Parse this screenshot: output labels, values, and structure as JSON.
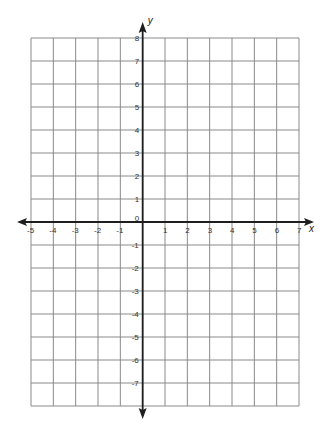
{
  "chart_data": {
    "type": "coordinate-grid",
    "title": "",
    "xlabel": "x",
    "ylabel": "y",
    "xlim": [
      -5,
      7
    ],
    "ylim": [
      -8,
      8
    ],
    "grid": true,
    "x_tick_labels": [
      "-5",
      "-4",
      "-3",
      "-2",
      "-1",
      "1",
      "2",
      "3",
      "4",
      "5",
      "6",
      "7"
    ],
    "x_tick_values": [
      -5,
      -4,
      -3,
      -2,
      -1,
      1,
      2,
      3,
      4,
      5,
      6,
      7
    ],
    "y_tick_labels": [
      "8",
      "7",
      "6",
      "5",
      "4",
      "3",
      "2",
      "1",
      "-1",
      "-2",
      "-3",
      "-4",
      "-5",
      "-6",
      "-7"
    ],
    "y_tick_values": [
      8,
      7,
      6,
      5,
      4,
      3,
      2,
      1,
      -1,
      -2,
      -3,
      -4,
      -5,
      -6,
      -7
    ],
    "origin_label": "0",
    "x_arrows": [
      "left",
      "right"
    ],
    "y_arrows": [
      "up",
      "down"
    ]
  },
  "colors": {
    "grid": "#8a8a8a",
    "axis": "#1e1e1e",
    "background": "#ffffff"
  }
}
